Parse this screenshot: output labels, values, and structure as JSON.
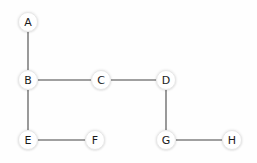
{
  "canvas": {
    "width": 257,
    "height": 163,
    "background_color": "#fefefe"
  },
  "style": {
    "node_fill": "#ffffff",
    "node_border": "#e8e8e8",
    "node_radius": 10,
    "label_color": "#1a1a1a",
    "edge_color": "#808080",
    "edge_width": 1.6
  },
  "graph": {
    "nodes": [
      {
        "id": "A",
        "label": "A",
        "x": 28,
        "y": 22
      },
      {
        "id": "B",
        "label": "B",
        "x": 28,
        "y": 80
      },
      {
        "id": "C",
        "label": "C",
        "x": 101,
        "y": 80
      },
      {
        "id": "D",
        "label": "D",
        "x": 166,
        "y": 80
      },
      {
        "id": "E",
        "label": "E",
        "x": 28,
        "y": 140
      },
      {
        "id": "F",
        "label": "F",
        "x": 95,
        "y": 140
      },
      {
        "id": "G",
        "label": "G",
        "x": 166,
        "y": 140
      },
      {
        "id": "H",
        "label": "H",
        "x": 232,
        "y": 140
      }
    ],
    "edges": [
      {
        "from": "A",
        "to": "B"
      },
      {
        "from": "B",
        "to": "C"
      },
      {
        "from": "C",
        "to": "D"
      },
      {
        "from": "B",
        "to": "E"
      },
      {
        "from": "E",
        "to": "F"
      },
      {
        "from": "D",
        "to": "G"
      },
      {
        "from": "G",
        "to": "H"
      }
    ]
  }
}
